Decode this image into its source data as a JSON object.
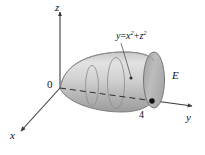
{
  "figure": {
    "background_color": "#ffffff",
    "axes": {
      "z_label": "z",
      "x_label": "x",
      "y_label": "y",
      "origin_label": "0",
      "axis_color": "#3b3b3b"
    },
    "annotations": {
      "surface_equation": "y = x² + z²",
      "surface_equation_lhs": "y",
      "surface_equation_operator": "=",
      "surface_equation_term1_base": "x",
      "surface_equation_term1_exp": "2",
      "surface_equation_plus": "+",
      "surface_equation_term2_base": "z",
      "surface_equation_term2_exp": "2",
      "solid_label": "E",
      "y_intercept_value": "4"
    },
    "solid": {
      "name": "paraboloid",
      "body_fill_light": "#dcdcdc",
      "body_fill_mid": "#b9b9b9",
      "body_fill_dark": "#9a9a9a",
      "cap_fill": "#b3b3b3",
      "outline_color": "#6e6e6e",
      "cross_section_color": "#8a8a8a",
      "dash_axis_color": "#2e2e2e",
      "marker_color": "#111111"
    }
  }
}
